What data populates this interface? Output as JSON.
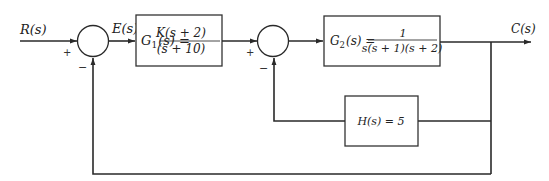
{
  "diagram": {
    "type": "block-diagram",
    "signals": {
      "input": "R(s)",
      "error": "E(s)",
      "output": "C(s)"
    },
    "blocks": {
      "g1": {
        "lhs": "G",
        "sub": "1",
        "arg": "(s) =",
        "num": "K(s + 2)",
        "den": "(s + 10)"
      },
      "g2": {
        "lhs": "G",
        "sub": "2",
        "arg": "(s) =",
        "num": "1",
        "den": "s(s + 1)(s + 2)"
      },
      "h": {
        "label": "H(s) = 5"
      }
    },
    "summing_junctions": [
      {
        "id": "sum1",
        "plus": "+",
        "minus": "−"
      },
      {
        "id": "sum2",
        "plus": "+",
        "minus": "−"
      }
    ],
    "colors": {
      "line": "#2a2a2a",
      "background": "#ffffff"
    }
  }
}
